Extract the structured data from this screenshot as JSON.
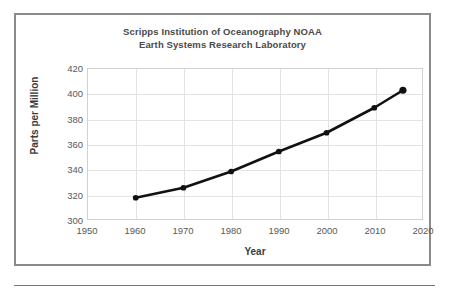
{
  "figure": {
    "title_line1": "Scripps Institution of Oceanography NOAA",
    "title_line2": "Earth Systems Research Laboratory",
    "border_color": "#8a8a8a",
    "rule_color": "#7a7a7a"
  },
  "chart_data": {
    "type": "line",
    "title": "Scripps Institution of Oceanography NOAA Earth Systems Research Laboratory",
    "xlabel": "Year",
    "ylabel": "Parts per Million",
    "xlim": [
      1950,
      2020
    ],
    "ylim": [
      300,
      420
    ],
    "xticks": [
      1950,
      1960,
      1970,
      1980,
      1990,
      2000,
      2010,
      2020
    ],
    "yticks": [
      300,
      320,
      340,
      360,
      380,
      400,
      420
    ],
    "grid": true,
    "legend": null,
    "series": [
      {
        "name": "Atmospheric CO2",
        "color": "#111111",
        "marker": "circle",
        "x": [
          1960,
          1970,
          1980,
          1990,
          2000,
          2010,
          2016
        ],
        "values": [
          317,
          325,
          338,
          354,
          369,
          389,
          403
        ]
      }
    ]
  }
}
